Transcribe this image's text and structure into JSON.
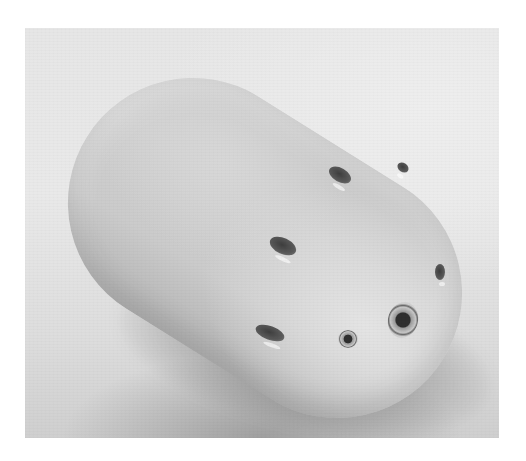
{
  "image": {
    "subject": "white capsule-shaped device with side holes",
    "style": "grayscale photograph",
    "frame": {
      "left": 25,
      "top": 28,
      "width": 474,
      "height": 410
    },
    "colors": {
      "page_background": "#ffffff",
      "photo_background": "#e6e6e6",
      "object_body": "#cfcfcf",
      "holes": "#3e3e3e",
      "shadow": "#5a5a5a"
    },
    "features": [
      {
        "name": "side-hole",
        "count": 4
      },
      {
        "name": "front-screw-fitting",
        "count": 1
      },
      {
        "name": "small-front-hole",
        "count": 1
      },
      {
        "name": "edge-hole",
        "count": 2
      }
    ]
  }
}
